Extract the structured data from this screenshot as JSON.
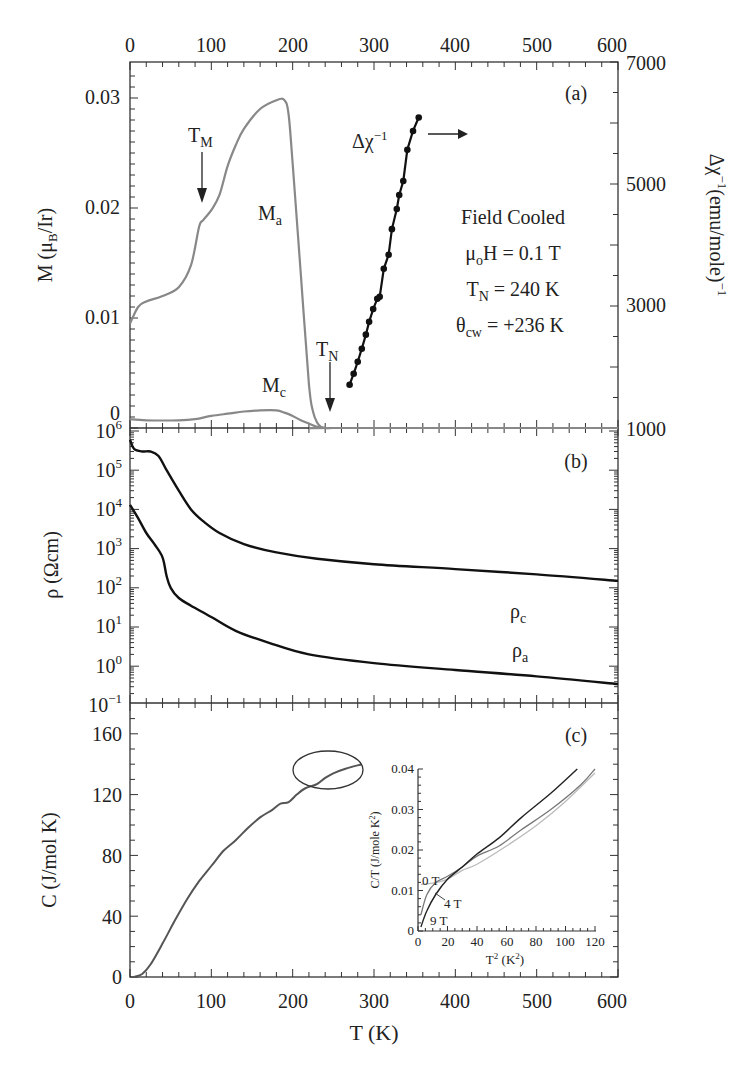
{
  "figure": {
    "xlabel": "T (K)",
    "top_ticks": [
      "0",
      "100",
      "200",
      "300",
      "400",
      "500",
      "600"
    ],
    "bottom_ticks": [
      "0",
      "100",
      "200",
      "300",
      "400",
      "500",
      "600"
    ]
  },
  "panel_a": {
    "tag": "(a)",
    "ylabel_left": "M (μB/Ir)",
    "ylabel_right": "Δχ⁻¹(emu/mole)⁻¹",
    "left_ticks": [
      "0.03",
      "0.02",
      "0.01",
      "0"
    ],
    "right_ticks": [
      "7000",
      "5000",
      "3000",
      "1000"
    ],
    "label_Ma": "Ma",
    "label_Mc": "Mc",
    "label_TM": "TM",
    "label_TN": "TN",
    "label_dchi": "Δχ⁻¹",
    "annotations": [
      "Field Cooled",
      "μoH = 0.1 T",
      "TN = 240 K",
      "θcw = +236 K"
    ]
  },
  "panel_b": {
    "tag": "(b)",
    "ylabel": "ρ (Ωcm)",
    "ticks": [
      "10^6",
      "10^5",
      "10^4",
      "10^3",
      "10^2",
      "10^1",
      "10^0",
      "10^-1"
    ],
    "label_rc": "ρc",
    "label_ra": "ρa"
  },
  "panel_c": {
    "tag": "(c)",
    "ylabel": "C (J/mol K)",
    "ticks": [
      "160",
      "120",
      "80",
      "40",
      "0"
    ],
    "inset": {
      "xlabel": "T² (K²)",
      "ylabel": "C/T (J/mole K²)",
      "xticks": [
        "0",
        "20",
        "40",
        "60",
        "80",
        "100",
        "120"
      ],
      "yticks": [
        "0.04",
        "0.03",
        "0.02",
        "0.01",
        "0"
      ],
      "labels": [
        "0 T",
        "4 T",
        "9 T"
      ]
    }
  },
  "chart_data": [
    {
      "type": "line",
      "title": "(a) Magnetization, field cooled",
      "xlabel": "T (K)",
      "ylabel": "M (μB/Ir)",
      "y2label": "Δχ⁻¹ (emu/mole)⁻¹",
      "xlim": [
        0,
        600
      ],
      "ylim": [
        0,
        0.033
      ],
      "y2lim": [
        1000,
        7000
      ],
      "series": [
        {
          "name": "Ma",
          "x": [
            0,
            10,
            20,
            40,
            60,
            75,
            85,
            90,
            100,
            110,
            120,
            130,
            140,
            160,
            180,
            190,
            195,
            200,
            210,
            220,
            225,
            230,
            235,
            240,
            250,
            300,
            600
          ],
          "y": [
            0.0095,
            0.011,
            0.0115,
            0.012,
            0.0128,
            0.0148,
            0.0183,
            0.0189,
            0.0198,
            0.0212,
            0.0238,
            0.0257,
            0.0272,
            0.029,
            0.0298,
            0.0298,
            0.0285,
            0.024,
            0.014,
            0.004,
            0.0015,
            0.0005,
            0.0001,
            0,
            0,
            0,
            0
          ]
        },
        {
          "name": "Mc",
          "x": [
            0,
            20,
            60,
            80,
            100,
            120,
            140,
            160,
            180,
            190,
            200,
            210,
            220,
            230,
            240,
            250,
            600
          ],
          "y": [
            0.0008,
            0.0007,
            0.0007,
            0.0008,
            0.0011,
            0.0013,
            0.0015,
            0.0016,
            0.0016,
            0.0014,
            0.0011,
            0.0007,
            0.0004,
            0.0001,
            0,
            0,
            0
          ]
        },
        {
          "name": "Δχ⁻¹",
          "axis": "right",
          "x": [
            270,
            275,
            280,
            285,
            290,
            294,
            299,
            304,
            307,
            312,
            318,
            322,
            328,
            331,
            336,
            341,
            348,
            355
          ],
          "y": [
            1710,
            1890,
            2085,
            2300,
            2530,
            2740,
            2950,
            3120,
            3150,
            3610,
            3840,
            4260,
            4590,
            4820,
            5050,
            5560,
            5870,
            6090
          ]
        }
      ],
      "annotations": [
        "TM ≈ 90 K",
        "TN ≈ 240 K",
        "Field Cooled",
        "μoH = 0.1 T",
        "TN = 240 K",
        "θcw = +236 K"
      ]
    },
    {
      "type": "line",
      "title": "(b) Resistivity",
      "xlabel": "T (K)",
      "ylabel": "ρ (Ωcm)",
      "yscale": "log",
      "ylim": [
        0.1,
        1000000
      ],
      "xlim": [
        0,
        600
      ],
      "series": [
        {
          "name": "ρc",
          "x": [
            0,
            5,
            15,
            25,
            35,
            45,
            60,
            75,
            90,
            110,
            140,
            180,
            230,
            300,
            400,
            500,
            600
          ],
          "y": [
            600000,
            350000,
            300000,
            300000,
            230000,
            100000,
            30000,
            10000,
            5000,
            2500,
            1300,
            800,
            550,
            400,
            300,
            220,
            150
          ]
        },
        {
          "name": "ρa",
          "x": [
            0,
            10,
            20,
            30,
            40,
            45,
            50,
            60,
            75,
            100,
            130,
            170,
            220,
            300,
            400,
            500,
            600
          ],
          "y": [
            13000,
            6000,
            2500,
            1300,
            600,
            200,
            100,
            55,
            35,
            18,
            8,
            4,
            2,
            1.2,
            0.8,
            0.55,
            0.35
          ]
        }
      ]
    },
    {
      "type": "line",
      "title": "(c) Specific heat",
      "xlabel": "T (K)",
      "ylabel": "C (J/mol K)",
      "xlim": [
        0,
        600
      ],
      "ylim": [
        0,
        170
      ],
      "series": [
        {
          "name": "C",
          "x": [
            5,
            15,
            25,
            40,
            55,
            70,
            85,
            100,
            115,
            130,
            145,
            160,
            175,
            185,
            195,
            205,
            215,
            230,
            240,
            250,
            265,
            285
          ],
          "y": [
            0,
            2,
            8,
            22,
            37,
            51,
            63,
            73,
            83,
            90,
            98,
            105,
            110,
            114,
            115,
            120,
            124,
            127,
            131,
            134,
            137,
            140
          ]
        }
      ],
      "annotations": [
        "ellipse around 210–285 K anomaly"
      ]
    },
    {
      "type": "line",
      "title": "(c) inset: C/T vs T²",
      "xlabel": "T² (K²)",
      "ylabel": "C/T (J/mole K²)",
      "xlim": [
        0,
        120
      ],
      "ylim": [
        0,
        0.04
      ],
      "series": [
        {
          "name": "0 T",
          "x": [
            2,
            10,
            20,
            30,
            40,
            60,
            80,
            100,
            120
          ],
          "y": [
            0.0115,
            0.0118,
            0.0128,
            0.015,
            0.0165,
            0.021,
            0.026,
            0.032,
            0.039
          ]
        },
        {
          "name": "4 T",
          "x": [
            2,
            6,
            12,
            20,
            30,
            40,
            55,
            70,
            90,
            110,
            120
          ],
          "y": [
            0.004,
            0.009,
            0.012,
            0.0135,
            0.0158,
            0.0185,
            0.021,
            0.025,
            0.03,
            0.036,
            0.04
          ]
        },
        {
          "name": "9 T",
          "x": [
            2,
            6,
            12,
            20,
            30,
            40,
            55,
            70,
            90,
            108
          ],
          "y": [
            0.001,
            0.005,
            0.009,
            0.0128,
            0.0158,
            0.019,
            0.023,
            0.028,
            0.034,
            0.04
          ]
        }
      ]
    }
  ]
}
